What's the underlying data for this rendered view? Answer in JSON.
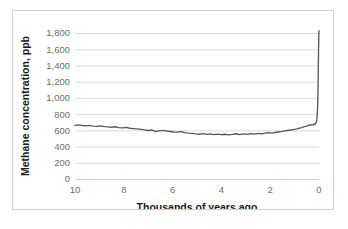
{
  "chart_data": {
    "type": "line",
    "title": "",
    "xlabel": "Thousands of years ago",
    "ylabel": "Methane concentration, ppb",
    "xlim": [
      10,
      0
    ],
    "ylim": [
      0,
      1800
    ],
    "x_reversed": true,
    "grid": true,
    "legend": null,
    "legend_position": "none",
    "line_color": "#595959",
    "grid_color": "#dcdcdc",
    "axis_label_color": "#6e6e6e",
    "background_color": "#ffffff",
    "border_color": "#d0d0d0",
    "xticks": [
      10,
      8,
      6,
      4,
      2,
      0
    ],
    "xtick_labels": [
      "10",
      "8",
      "6",
      "4",
      "2",
      "0"
    ],
    "yticks": [
      0,
      200,
      400,
      600,
      800,
      1000,
      1200,
      1400,
      1600,
      1800
    ],
    "ytick_labels": [
      "0",
      "200",
      "400",
      "600",
      "800",
      "1,000",
      "1,200",
      "1,400",
      "1,600",
      "1,800"
    ],
    "series": [
      {
        "name": "Methane concentration",
        "x": [
          10.0,
          9.85,
          9.7,
          9.55,
          9.4,
          9.25,
          9.1,
          8.95,
          8.8,
          8.65,
          8.5,
          8.35,
          8.2,
          8.05,
          7.9,
          7.75,
          7.6,
          7.45,
          7.3,
          7.15,
          7.0,
          6.85,
          6.7,
          6.55,
          6.4,
          6.25,
          6.1,
          5.95,
          5.8,
          5.65,
          5.5,
          5.35,
          5.2,
          5.05,
          4.9,
          4.75,
          4.6,
          4.45,
          4.3,
          4.15,
          4.0,
          3.85,
          3.7,
          3.55,
          3.4,
          3.25,
          3.1,
          2.95,
          2.8,
          2.65,
          2.5,
          2.35,
          2.2,
          2.05,
          1.9,
          1.75,
          1.6,
          1.45,
          1.3,
          1.15,
          1.0,
          0.9,
          0.8,
          0.7,
          0.6,
          0.5,
          0.42,
          0.35,
          0.3,
          0.25,
          0.2,
          0.17,
          0.15,
          0.13,
          0.11,
          0.09,
          0.07,
          0.05,
          0.04,
          0.03,
          0.02,
          0.01,
          0.0
        ],
        "values": [
          662,
          668,
          660,
          655,
          661,
          652,
          648,
          654,
          645,
          642,
          638,
          644,
          634,
          630,
          636,
          626,
          622,
          618,
          612,
          606,
          598,
          604,
          586,
          594,
          600,
          592,
          586,
          580,
          578,
          584,
          572,
          566,
          562,
          556,
          552,
          560,
          550,
          556,
          548,
          554,
          546,
          552,
          544,
          550,
          558,
          548,
          556,
          550,
          560,
          554,
          562,
          556,
          566,
          572,
          566,
          576,
          582,
          590,
          598,
          604,
          612,
          618,
          628,
          634,
          646,
          652,
          668,
          660,
          674,
          666,
          678,
          672,
          684,
          690,
          700,
          730,
          800,
          950,
          1120,
          1330,
          1560,
          1740,
          1830
        ]
      }
    ],
    "peak_value": 1830,
    "min_value": 544,
    "start_value": 662
  }
}
